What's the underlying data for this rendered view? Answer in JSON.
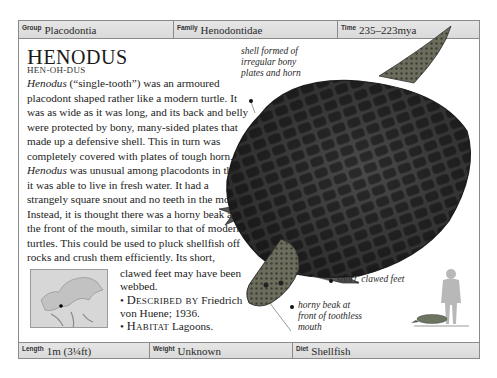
{
  "header": {
    "group": {
      "label": "Group",
      "value": "Placodontia"
    },
    "family": {
      "label": "Family",
      "value": "Henodontidae"
    },
    "time": {
      "label": "Time",
      "value": "235–223mya"
    }
  },
  "entry": {
    "name_first": "H",
    "name_rest": "ENODUS",
    "pronunciation": "HEN-OH-DUS",
    "body_italic_1": "Henodus",
    "body_1": " (“single-tooth”) was an armoured placodont shaped rather like a modern turtle. It was as wide as it was long, and its back and belly were protected by bony, many-sided plates that made up a defensive shell. This in turn was completely covered with plates of tough horn. ",
    "body_italic_2": "Henodus",
    "body_2": " was unusual among placodonts in that it was able to live in fresh water. It had a strangely square snout and no teeth in the mouth. Instead, it is thought there was a horny beak at the front of the mouth, similar to that of modern turtles. This could be used to pluck shellfish off rocks and crush them efficiently. Its short,",
    "body_3": "clawed feet may have been webbed.",
    "described_by_label": "Described by",
    "described_by_value": " Friedrich von Huene; 1936.",
    "habitat_label": "Habitat",
    "habitat_value": " Lagoons."
  },
  "callouts": {
    "shell": "shell formed of irregular bony plates and horn",
    "feet": "short, clawed feet",
    "beak": "horny beak at front of toothless mouth"
  },
  "footer": {
    "length": {
      "label": "Length",
      "value": "1m (3¼ft)"
    },
    "weight": {
      "label": "Weight",
      "value": "Unknown"
    },
    "diet": {
      "label": "Diet",
      "value": "Shellfish"
    }
  }
}
